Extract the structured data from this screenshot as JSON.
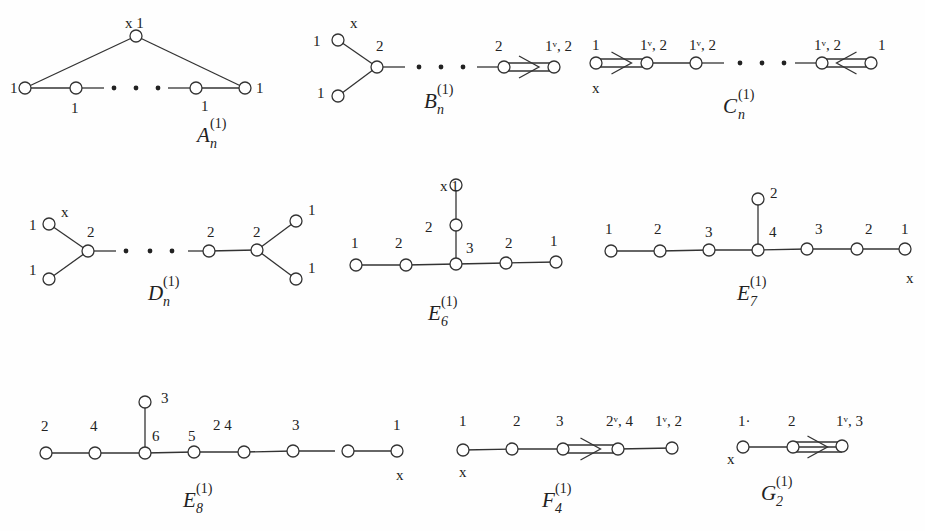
{
  "diagrams": [
    {
      "id": "A",
      "name": "A",
      "subscript": "n",
      "superscript": "(1)",
      "name_pos": [
        197,
        142
      ],
      "nodes": [
        {
          "x": 136,
          "y": 36,
          "label": "x 1",
          "lx": 125,
          "ly": 28
        },
        {
          "x": 25,
          "y": 88,
          "label": "1",
          "lx": 10,
          "ly": 93
        },
        {
          "x": 76,
          "y": 88,
          "label": "1",
          "lx": 71,
          "ly": 113
        },
        {
          "x": 196,
          "y": 88,
          "label": "1",
          "lx": 201,
          "ly": 111
        },
        {
          "x": 245,
          "y": 88,
          "label": "1",
          "lx": 256,
          "ly": 93
        }
      ],
      "edges": [
        [
          0,
          1
        ],
        [
          0,
          4
        ],
        [
          1,
          2
        ]
      ],
      "partial_edges": [
        [
          76,
          88,
          104,
          88
        ],
        [
          168,
          88,
          196,
          88
        ],
        [
          196,
          88,
          245,
          88
        ]
      ],
      "dots": [
        [
          114,
          88
        ],
        [
          136,
          88
        ],
        [
          158,
          88
        ]
      ]
    },
    {
      "id": "B",
      "name": "B",
      "subscript": "n",
      "superscript": "(1)",
      "name_pos": [
        424,
        108
      ],
      "nodes": [
        {
          "x": 338,
          "y": 40,
          "label": "1",
          "lx": 313,
          "ly": 46
        },
        {
          "x": 338,
          "y": 96,
          "label": "1",
          "lx": 317,
          "ly": 98
        },
        {
          "x": 377,
          "y": 67,
          "label": "2",
          "lx": 376,
          "ly": 51
        },
        {
          "x": 504,
          "y": 67,
          "label": "2",
          "lx": 495,
          "ly": 51
        },
        {
          "x": 554,
          "y": 67,
          "label": "1ᵛ, 2",
          "lx": 545,
          "ly": 51
        }
      ],
      "extra_labels": [
        {
          "text": "x",
          "x": 350,
          "y": 28
        }
      ],
      "edges": [
        [
          0,
          2
        ],
        [
          1,
          2
        ]
      ],
      "partial_edges": [
        [
          377,
          67,
          405,
          67
        ]
      ],
      "dots": [
        [
          419,
          67
        ],
        [
          441,
          67
        ],
        [
          463,
          67
        ]
      ],
      "partial_edges2": [
        [
          477,
          67,
          504,
          67
        ]
      ],
      "double": {
        "from": 504,
        "to": 554,
        "y": 67,
        "dir": "right"
      }
    },
    {
      "id": "C",
      "name": "C",
      "subscript": "n",
      "superscript": "(1)",
      "name_pos": [
        723,
        113
      ],
      "nodes": [
        {
          "x": 596,
          "y": 63,
          "label": "1",
          "lx": 592,
          "ly": 50
        },
        {
          "x": 647,
          "y": 63,
          "label": "1ᵛ, 2",
          "lx": 640,
          "ly": 50
        },
        {
          "x": 696,
          "y": 63,
          "label": "1ᵛ, 2",
          "lx": 689,
          "ly": 50
        },
        {
          "x": 822,
          "y": 63,
          "label": "1ᵛ, 2",
          "lx": 814,
          "ly": 50
        },
        {
          "x": 871,
          "y": 63,
          "label": "1",
          "lx": 878,
          "ly": 50
        }
      ],
      "extra_labels": [
        {
          "text": "x",
          "x": 592,
          "y": 93
        }
      ],
      "edges": [
        [
          1,
          2
        ]
      ],
      "partial_edges": [
        [
          696,
          63,
          724,
          63
        ],
        [
          795,
          63,
          822,
          63
        ]
      ],
      "dots": [
        [
          740,
          63
        ],
        [
          762,
          63
        ],
        [
          784,
          63
        ]
      ],
      "double_left": {
        "from": 596,
        "to": 647,
        "y": 63,
        "dir": "right"
      },
      "double_right": {
        "from": 822,
        "to": 871,
        "y": 63,
        "dir": "left"
      }
    },
    {
      "id": "D",
      "name": "D",
      "subscript": "n",
      "superscript": "(1)",
      "name_pos": [
        148,
        300
      ],
      "nodes": [
        {
          "x": 49,
          "y": 224,
          "label": "1",
          "lx": 29,
          "ly": 230
        },
        {
          "x": 49,
          "y": 279,
          "label": "1",
          "lx": 29,
          "ly": 275
        },
        {
          "x": 88,
          "y": 251,
          "label": "2",
          "lx": 87,
          "ly": 237
        },
        {
          "x": 209,
          "y": 251,
          "label": "2",
          "lx": 207,
          "ly": 237
        },
        {
          "x": 257,
          "y": 250,
          "label": "2",
          "lx": 253,
          "ly": 237
        },
        {
          "x": 296,
          "y": 221,
          "label": "1",
          "lx": 308,
          "ly": 215
        },
        {
          "x": 296,
          "y": 279,
          "label": "1",
          "lx": 308,
          "ly": 273
        }
      ],
      "extra_labels": [
        {
          "text": "x",
          "x": 61,
          "y": 217
        }
      ],
      "edges": [
        [
          0,
          2
        ],
        [
          1,
          2
        ],
        [
          3,
          4
        ],
        [
          4,
          5
        ],
        [
          4,
          6
        ]
      ],
      "partial_edges": [
        [
          88,
          251,
          116,
          251
        ],
        [
          188,
          251,
          209,
          251
        ]
      ],
      "dots": [
        [
          126,
          251
        ],
        [
          150,
          251
        ],
        [
          172,
          251
        ]
      ]
    },
    {
      "id": "E6",
      "name": "E",
      "subscript": "6",
      "superscript": "(1)",
      "name_pos": [
        428,
        320
      ],
      "nodes": [
        {
          "x": 356,
          "y": 265,
          "label": "1",
          "lx": 351,
          "ly": 248
        },
        {
          "x": 406,
          "y": 265,
          "label": "2",
          "lx": 395,
          "ly": 248
        },
        {
          "x": 456,
          "y": 264,
          "label": "3",
          "lx": 466,
          "ly": 253
        },
        {
          "x": 506,
          "y": 263,
          "label": "2",
          "lx": 505,
          "ly": 248
        },
        {
          "x": 556,
          "y": 262,
          "label": "1",
          "lx": 550,
          "ly": 246
        },
        {
          "x": 456,
          "y": 225,
          "label": "2",
          "lx": 425,
          "ly": 232
        },
        {
          "x": 456,
          "y": 185,
          "label": "x 1",
          "lx": 440,
          "ly": 191
        }
      ],
      "edges": [
        [
          0,
          1
        ],
        [
          1,
          2
        ],
        [
          2,
          3
        ],
        [
          3,
          4
        ],
        [
          2,
          5
        ],
        [
          5,
          6
        ]
      ]
    },
    {
      "id": "E7",
      "name": "E",
      "subscript": "7",
      "superscript": "(1)",
      "name_pos": [
        737,
        300
      ],
      "nodes": [
        {
          "x": 611,
          "y": 251,
          "label": "1",
          "lx": 605,
          "ly": 234
        },
        {
          "x": 660,
          "y": 251,
          "label": "2",
          "lx": 654,
          "ly": 234
        },
        {
          "x": 709,
          "y": 250,
          "label": "3",
          "lx": 705,
          "ly": 237
        },
        {
          "x": 758,
          "y": 250,
          "label": "4",
          "lx": 769,
          "ly": 237
        },
        {
          "x": 807,
          "y": 249,
          "label": "3",
          "lx": 815,
          "ly": 234
        },
        {
          "x": 857,
          "y": 249,
          "label": "2",
          "lx": 865,
          "ly": 234
        },
        {
          "x": 905,
          "y": 249,
          "label": "1",
          "lx": 901,
          "ly": 234
        },
        {
          "x": 758,
          "y": 199,
          "label": "2",
          "lx": 770,
          "ly": 198
        }
      ],
      "extra_labels": [
        {
          "text": "x",
          "x": 906,
          "y": 283
        }
      ],
      "edges": [
        [
          0,
          1
        ],
        [
          1,
          2
        ],
        [
          2,
          3
        ],
        [
          3,
          4
        ],
        [
          4,
          5
        ],
        [
          5,
          6
        ],
        [
          3,
          7
        ]
      ]
    },
    {
      "id": "E8",
      "name": "E",
      "subscript": "8",
      "superscript": "(1)",
      "name_pos": [
        183,
        507
      ],
      "nodes": [
        {
          "x": 46,
          "y": 453,
          "label": "2",
          "lx": 41,
          "ly": 431
        },
        {
          "x": 95,
          "y": 453,
          "label": "4",
          "lx": 90,
          "ly": 431
        },
        {
          "x": 145,
          "y": 453,
          "label": "6",
          "lx": 152,
          "ly": 441
        },
        {
          "x": 194,
          "y": 452,
          "label": "5",
          "lx": 188,
          "ly": 441
        },
        {
          "x": 244,
          "y": 452,
          "label": "2  4",
          "lx": 213,
          "ly": 430
        },
        {
          "x": 293,
          "y": 451,
          "label": "3",
          "lx": 292,
          "ly": 430
        },
        {
          "x": 348,
          "y": 451,
          "label": "",
          "lx": 0,
          "ly": 0
        },
        {
          "x": 397,
          "y": 451,
          "label": "1",
          "lx": 393,
          "ly": 430
        },
        {
          "x": 145,
          "y": 402,
          "label": "3",
          "lx": 161,
          "ly": 403
        }
      ],
      "extra_labels": [
        {
          "text": "x",
          "x": 396,
          "y": 480
        }
      ],
      "edges": [
        [
          0,
          1
        ],
        [
          1,
          2
        ],
        [
          2,
          3
        ],
        [
          3,
          4
        ],
        [
          4,
          5
        ],
        [
          6,
          7
        ],
        [
          2,
          8
        ]
      ],
      "partial_edges": [
        [
          293,
          451,
          335,
          451
        ]
      ]
    },
    {
      "id": "F4",
      "name": "F",
      "subscript": "4",
      "superscript": "(1)",
      "name_pos": [
        542,
        507
      ],
      "nodes": [
        {
          "x": 463,
          "y": 450,
          "label": "1",
          "lx": 459,
          "ly": 426
        },
        {
          "x": 512,
          "y": 449,
          "label": "2",
          "lx": 513,
          "ly": 426
        },
        {
          "x": 563,
          "y": 449,
          "label": "3",
          "lx": 556,
          "ly": 426
        },
        {
          "x": 618,
          "y": 449,
          "label": "2ᵛ, 4",
          "lx": 606,
          "ly": 426
        },
        {
          "x": 672,
          "y": 448,
          "label": "1ᵛ, 2",
          "lx": 655,
          "ly": 426
        }
      ],
      "extra_labels": [
        {
          "text": "x",
          "x": 459,
          "y": 477
        }
      ],
      "edges": [
        [
          0,
          1
        ],
        [
          1,
          2
        ],
        [
          3,
          4
        ]
      ],
      "double": {
        "from": 563,
        "to": 618,
        "y": 449,
        "dir": "right"
      }
    },
    {
      "id": "G2",
      "name": "G",
      "subscript": "2",
      "superscript": "(1)",
      "name_pos": [
        761,
        500
      ],
      "nodes": [
        {
          "x": 743,
          "y": 447,
          "label": "1·",
          "lx": 738,
          "ly": 426
        },
        {
          "x": 793,
          "y": 447,
          "label": "2",
          "lx": 788,
          "ly": 426
        },
        {
          "x": 842,
          "y": 446,
          "label": "1ᵛ, 3",
          "lx": 836,
          "ly": 426
        }
      ],
      "extra_labels": [
        {
          "text": "x",
          "x": 727,
          "y": 464
        }
      ],
      "edges": [
        [
          0,
          1
        ]
      ],
      "triple": {
        "from": 793,
        "to": 842,
        "y": 447,
        "dir": "right"
      }
    }
  ]
}
